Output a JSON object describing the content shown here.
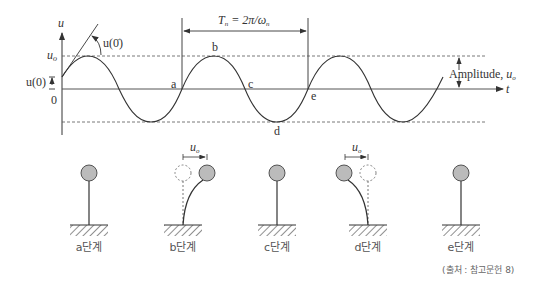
{
  "diagram": {
    "axes": {
      "y_label": "u",
      "x_label": "t",
      "u_o_label": "u",
      "u_o_sub": "o",
      "u0_label": "u(0)",
      "zero_label": "0",
      "slope_label": "u(0̇)"
    },
    "period": {
      "label": "T",
      "sub": "n",
      "formula": " = 2π/ω",
      "formula_sub": "n"
    },
    "amplitude": {
      "label": "Amplitude, ",
      "symbol": "u",
      "sub": "o"
    },
    "points": {
      "a": "a",
      "b": "b",
      "c": "c",
      "d": "d",
      "e": "e"
    },
    "stages": [
      {
        "label": "a단계"
      },
      {
        "label": "b단계"
      },
      {
        "label": "c단계"
      },
      {
        "label": "d단계"
      },
      {
        "label": "e단계"
      }
    ],
    "disp_label": "u",
    "disp_sub": "o",
    "source": "(출처 : 참고문헌 8)"
  },
  "colors": {
    "line": "#333333",
    "ball_fill": "#bbbbbb",
    "dash": "#555555"
  }
}
